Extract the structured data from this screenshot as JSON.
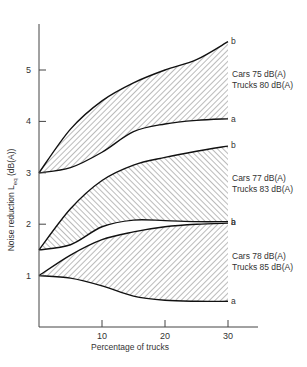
{
  "chart_data": {
    "type": "area",
    "title": "",
    "xlabel": "Percentage of trucks",
    "ylabel": "Noise reduction L_eq (dB(A))",
    "ylabel_parts": {
      "pre": "Noise reduction L",
      "sub": "eq",
      "post": " (dB(A))"
    },
    "xlim": [
      0,
      34
    ],
    "ylim": [
      0,
      5.9
    ],
    "xticks": [
      10,
      20,
      30
    ],
    "yticks": [
      1,
      2,
      3,
      4,
      5
    ],
    "grid": false,
    "x": [
      0,
      5,
      10,
      15,
      20,
      25,
      30
    ],
    "series": [
      {
        "name": "Cars 75 dB(A) Trucks 80 dB(A)",
        "label_line1": "Cars 75 dB(A)",
        "label_line2": "Trucks 80 dB(A)",
        "hatch": "forward",
        "upper": {
          "name": "b",
          "values": [
            3.0,
            3.85,
            4.4,
            4.75,
            5.0,
            5.2,
            5.55
          ]
        },
        "lower": {
          "name": "a",
          "values": [
            3.0,
            3.1,
            3.4,
            3.8,
            3.95,
            4.02,
            4.05
          ]
        }
      },
      {
        "name": "Cars 77 dB(A) Trucks 83 dB(A)",
        "label_line1": "Cars 77 dB(A)",
        "label_line2": "Trucks 83 dB(A)",
        "hatch": "backward",
        "upper": {
          "name": "b",
          "values": [
            1.5,
            2.3,
            2.85,
            3.15,
            3.3,
            3.42,
            3.52
          ]
        },
        "lower": {
          "name": "a",
          "values": [
            1.5,
            1.6,
            1.95,
            2.08,
            2.07,
            2.05,
            2.05
          ]
        }
      },
      {
        "name": "Cars 78 dB(A) Trucks 85 dB(A)",
        "label_line1": "Cars 78 dB(A)",
        "label_line2": "Trucks 85 dB(A)",
        "hatch": "forward",
        "upper": {
          "name": "b",
          "values": [
            1.0,
            1.4,
            1.7,
            1.85,
            1.95,
            2.0,
            2.02
          ]
        },
        "lower": {
          "name": "a",
          "values": [
            1.0,
            0.95,
            0.8,
            0.6,
            0.52,
            0.5,
            0.5
          ]
        }
      }
    ]
  }
}
